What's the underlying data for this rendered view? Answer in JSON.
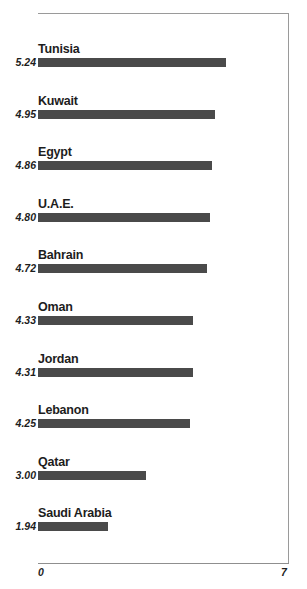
{
  "chart_data": {
    "type": "bar",
    "orientation": "horizontal",
    "title": "",
    "subtitle": "",
    "xlabel": "",
    "ylabel": "",
    "categories": [
      "Tunisia",
      "Kuwait",
      "Egypt",
      "U.A.E.",
      "Bahrain",
      "Oman",
      "Jordan",
      "Lebanon",
      "Qatar",
      "Saudi Arabia"
    ],
    "values": [
      5.24,
      4.95,
      4.86,
      4.8,
      4.72,
      4.33,
      4.31,
      4.25,
      3.0,
      1.94
    ],
    "value_labels": [
      "5.24",
      "4.95",
      "4.86",
      "4.80",
      "4.72",
      "4.33",
      "4.31",
      "4.25",
      "3.00",
      "1.94"
    ],
    "xlim": [
      0,
      7
    ],
    "x_ticks": [
      0,
      7
    ],
    "x_tick_labels": [
      "0",
      "7"
    ],
    "grid": false,
    "legend": false,
    "bar_color": "#4a4a4a",
    "frame_color": "#9a9a9a",
    "axis_color": "#8f8f8f",
    "text_color": "#1d1d1d",
    "background": "#ffffff"
  },
  "axis": {
    "min_label": "0",
    "max_label": "7"
  }
}
